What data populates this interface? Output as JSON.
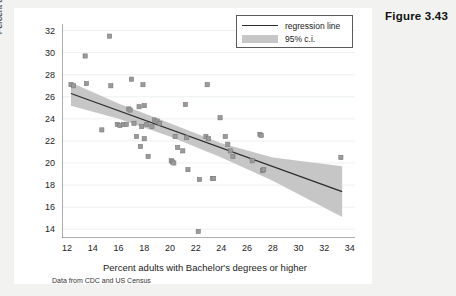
{
  "figure": {
    "caption": "Figure 3.43",
    "note": "Data from CDC and US Census"
  },
  "legend": {
    "position": "top-right",
    "items": [
      {
        "key": "regression-line",
        "label": "regression line"
      },
      {
        "key": "confidence-band",
        "label": "95% c.i."
      }
    ]
  },
  "colors": {
    "page_background": "#f2f2f0",
    "canvas": "#ffffff",
    "marker": "#9a9a9a",
    "marker_edge": "#7a7a7a",
    "regression_line": "#2b2b2b",
    "confidence_band": "#c6c6c6",
    "gridline": "#eceff1",
    "axis": "#5a5a5a",
    "text": "#1a1a1a"
  },
  "chart_data": {
    "type": "scatter",
    "title": "",
    "subtitle": "",
    "xlabel": "Percent adults with Bachelor's degrees or higher",
    "ylabel": "Percent adults smoking",
    "note": "Data from CDC and US Census",
    "xlim": [
      11.6,
      34.4
    ],
    "ylim": [
      13.2,
      32.6
    ],
    "xticks": [
      12,
      14,
      16,
      18,
      20,
      22,
      24,
      26,
      28,
      30,
      32,
      34
    ],
    "yticks": [
      14,
      16,
      18,
      20,
      22,
      24,
      26,
      28,
      30,
      32
    ],
    "grid": "horizontal",
    "legend_position": "top-right",
    "points": [
      {
        "x": 12.3,
        "y": 27.1
      },
      {
        "x": 12.5,
        "y": 27.0
      },
      {
        "x": 13.4,
        "y": 29.7
      },
      {
        "x": 13.5,
        "y": 27.2
      },
      {
        "x": 14.7,
        "y": 23.0
      },
      {
        "x": 15.3,
        "y": 31.5
      },
      {
        "x": 15.4,
        "y": 27.0
      },
      {
        "x": 15.9,
        "y": 23.5
      },
      {
        "x": 16.1,
        "y": 23.4
      },
      {
        "x": 16.4,
        "y": 23.5
      },
      {
        "x": 16.6,
        "y": 23.5
      },
      {
        "x": 16.8,
        "y": 24.9
      },
      {
        "x": 16.9,
        "y": 24.8
      },
      {
        "x": 17.0,
        "y": 27.6
      },
      {
        "x": 17.2,
        "y": 23.6
      },
      {
        "x": 17.4,
        "y": 22.4
      },
      {
        "x": 17.6,
        "y": 25.1
      },
      {
        "x": 17.7,
        "y": 21.5
      },
      {
        "x": 17.8,
        "y": 23.3
      },
      {
        "x": 17.9,
        "y": 27.1
      },
      {
        "x": 18.0,
        "y": 25.2
      },
      {
        "x": 18.0,
        "y": 22.2
      },
      {
        "x": 18.2,
        "y": 23.5
      },
      {
        "x": 18.3,
        "y": 20.6
      },
      {
        "x": 18.6,
        "y": 23.3
      },
      {
        "x": 18.8,
        "y": 23.9
      },
      {
        "x": 19.0,
        "y": 23.8
      },
      {
        "x": 19.2,
        "y": 23.6
      },
      {
        "x": 20.1,
        "y": 20.2
      },
      {
        "x": 20.2,
        "y": 20.1
      },
      {
        "x": 20.3,
        "y": 20.0
      },
      {
        "x": 20.4,
        "y": 22.4
      },
      {
        "x": 20.6,
        "y": 21.4
      },
      {
        "x": 21.0,
        "y": 21.1
      },
      {
        "x": 21.2,
        "y": 25.3
      },
      {
        "x": 21.3,
        "y": 22.3
      },
      {
        "x": 21.4,
        "y": 19.4
      },
      {
        "x": 22.2,
        "y": 13.8
      },
      {
        "x": 22.3,
        "y": 18.5
      },
      {
        "x": 22.8,
        "y": 22.4
      },
      {
        "x": 22.9,
        "y": 27.1
      },
      {
        "x": 23.0,
        "y": 22.2
      },
      {
        "x": 23.3,
        "y": 18.6
      },
      {
        "x": 23.4,
        "y": 18.6
      },
      {
        "x": 23.9,
        "y": 24.1
      },
      {
        "x": 24.3,
        "y": 22.4
      },
      {
        "x": 24.5,
        "y": 21.7
      },
      {
        "x": 24.7,
        "y": 21.1
      },
      {
        "x": 24.9,
        "y": 20.6
      },
      {
        "x": 26.4,
        "y": 20.2
      },
      {
        "x": 27.0,
        "y": 22.6
      },
      {
        "x": 27.1,
        "y": 22.5
      },
      {
        "x": 27.2,
        "y": 19.3
      },
      {
        "x": 27.3,
        "y": 19.4
      },
      {
        "x": 33.3,
        "y": 20.5
      }
    ],
    "regression": {
      "label": "regression line",
      "x_start": 12.3,
      "y_start": 26.3,
      "x_end": 33.4,
      "y_end": 17.4
    },
    "confidence_band": {
      "label": "95% c.i.",
      "level": 95,
      "upper": [
        {
          "x": 12.3,
          "y": 27.3
        },
        {
          "x": 16.0,
          "y": 25.4
        },
        {
          "x": 20.0,
          "y": 23.6
        },
        {
          "x": 24.0,
          "y": 21.8
        },
        {
          "x": 28.0,
          "y": 20.5
        },
        {
          "x": 33.4,
          "y": 19.7
        }
      ],
      "lower": [
        {
          "x": 12.3,
          "y": 25.2
        },
        {
          "x": 16.0,
          "y": 24.0
        },
        {
          "x": 20.0,
          "y": 22.4
        },
        {
          "x": 24.0,
          "y": 20.5
        },
        {
          "x": 28.0,
          "y": 18.4
        },
        {
          "x": 33.4,
          "y": 15.1
        }
      ]
    }
  }
}
